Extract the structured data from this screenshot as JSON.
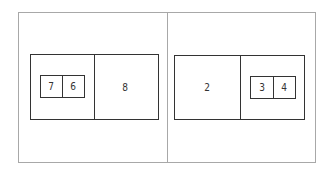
{
  "diagram": {
    "left_panel": {
      "big_box": {
        "left_cell": {
          "small_boxes": [
            {
              "label": "7"
            },
            {
              "label": "6"
            }
          ]
        },
        "right_cell": {
          "label": "8"
        }
      }
    },
    "right_panel": {
      "big_box": {
        "left_cell": {
          "label": "2"
        },
        "right_cell": {
          "small_boxes": [
            {
              "label": "3"
            },
            {
              "label": "4"
            }
          ]
        }
      }
    }
  },
  "colors": {
    "frame": "#a8a8a8",
    "box": "#333333",
    "text": "#333333",
    "background": "#ffffff"
  }
}
